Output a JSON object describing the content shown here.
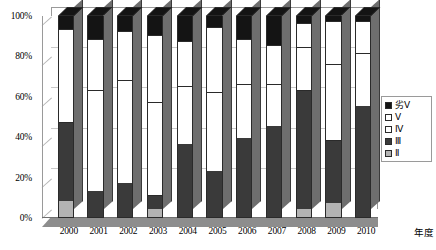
{
  "chart_data": {
    "type": "bar",
    "subtype": "stacked-100-percent-3d",
    "title": "",
    "xlabel": "年度",
    "ylabel": "",
    "categories": [
      "2000",
      "2001",
      "2002",
      "2003",
      "2004",
      "2005",
      "2006",
      "2007",
      "2008",
      "2009",
      "2010"
    ],
    "ylim": [
      0,
      100
    ],
    "ytick_labels": [
      "0%",
      "20%",
      "40%",
      "60%",
      "80%",
      "100%"
    ],
    "ytick_values": [
      0,
      20,
      40,
      60,
      80,
      100
    ],
    "grid": true,
    "legend_position": "right",
    "series": [
      {
        "name": "II",
        "color": "#b3b3b3",
        "values": [
          8,
          0,
          0,
          4,
          0,
          0,
          0,
          0,
          4,
          7,
          0
        ]
      },
      {
        "name": "III",
        "color": "#3a3a3a",
        "values": [
          39,
          13,
          17,
          7,
          36,
          23,
          39,
          45,
          59,
          31,
          55
        ]
      },
      {
        "name": "IV",
        "color": "#ffffff",
        "values": [
          46,
          50,
          51,
          46,
          29,
          39,
          27,
          21,
          21,
          38,
          26
        ]
      },
      {
        "name": "V",
        "color": "#ffffff",
        "values": [
          0,
          25,
          24,
          33,
          22,
          32,
          22,
          19,
          12,
          21,
          16
        ]
      },
      {
        "name": "劣V",
        "color": "#141414",
        "values": [
          7,
          12,
          8,
          10,
          13,
          6,
          12,
          15,
          4,
          3,
          3
        ]
      }
    ]
  },
  "legend": {
    "items": [
      {
        "label": "劣Ⅴ",
        "swatch": "black-swatch"
      },
      {
        "label": "Ⅴ",
        "swatch": "white-swatch"
      },
      {
        "label": "Ⅳ",
        "swatch": "white-swatch"
      },
      {
        "label": "Ⅲ",
        "swatch": "dark-gray-swatch"
      },
      {
        "label": "Ⅱ",
        "swatch": "light-gray-swatch"
      }
    ]
  },
  "colors": {
    "II": "#b3b3b3",
    "III": "#3a3a3a",
    "IV": "#ffffff",
    "V": "#ffffff",
    "worse_V": "#141414",
    "grid": "#c9c9c9",
    "axis": "#9a9a9a",
    "floor": "#8d8d8d",
    "bar_side": "#6e6e6e"
  }
}
